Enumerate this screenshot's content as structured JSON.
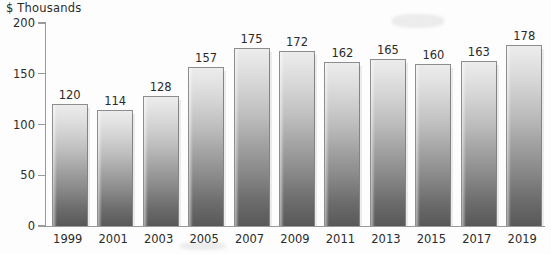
{
  "chart_data": {
    "type": "bar",
    "title": "$ Thousands",
    "xlabel": "",
    "ylabel": "$ Thousands",
    "categories": [
      "1999",
      "2001",
      "2003",
      "2005",
      "2007",
      "2009",
      "2011",
      "2013",
      "2015",
      "2017",
      "2019"
    ],
    "values": [
      120,
      114,
      128,
      157,
      175,
      172,
      162,
      165,
      160,
      163,
      178
    ],
    "value_labels": [
      "120",
      "114",
      "128",
      "157",
      "175",
      "172",
      "162",
      "165",
      "160",
      "163",
      "178"
    ],
    "ylim": [
      0,
      200
    ],
    "y_ticks": [
      0,
      50,
      100,
      150,
      200
    ],
    "y_tick_labels": [
      "0",
      "50",
      "100",
      "150",
      "200"
    ],
    "grid": false,
    "legend": null,
    "legend_position": "none",
    "bar_fill_top_color": "#ececec",
    "bar_fill_bottom_color": "#585858",
    "bar_border_color": "#8d8d8d",
    "axis_color": "#9a9a9a",
    "text_color": "#2b2b2b",
    "background_color": "#fdfdfd"
  }
}
